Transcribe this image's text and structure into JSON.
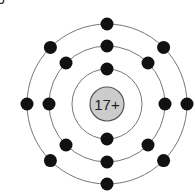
{
  "corner_label": "b",
  "atom": {
    "nucleus_label": "17+",
    "nucleus_fill": "#cccccc",
    "nucleus_stroke": "#555555",
    "electron_color": "#111111",
    "shell_color": "#777777",
    "center": [
      107,
      104
    ],
    "nucleus_radius": 17,
    "shells": [
      {
        "radius": 35,
        "electron_count": 2,
        "electron_angles_deg": [
          270,
          90
        ]
      },
      {
        "radius": 58,
        "electron_count": 8,
        "electron_angles_deg": [
          270,
          315,
          0,
          45,
          90,
          135,
          180,
          225
        ]
      },
      {
        "radius": 80,
        "electron_count": 8,
        "electron_angles_deg": [
          270,
          315,
          0,
          45,
          90,
          135,
          180,
          225
        ]
      }
    ]
  }
}
